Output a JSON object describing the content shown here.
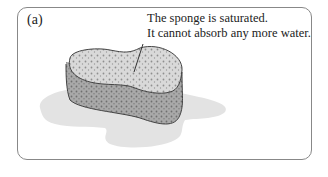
{
  "figure": {
    "panel_label": "(a)",
    "caption_lines": [
      "The sponge is saturated.",
      "It cannot absorb any more water."
    ],
    "elements": [
      "sponge",
      "water-puddle",
      "leader-line"
    ],
    "colors": {
      "border": "#888888",
      "puddle": "#e3e3e3",
      "sponge_top": "#d6d6d6",
      "sponge_side": "#a8a8a8",
      "outline": "#444444"
    }
  }
}
